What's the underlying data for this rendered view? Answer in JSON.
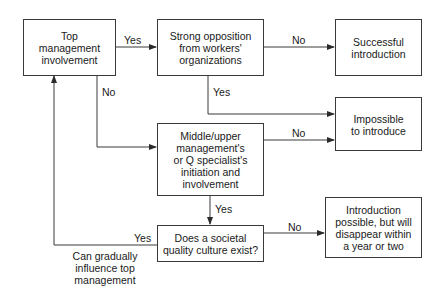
{
  "diagram": {
    "type": "flowchart",
    "nodes": {
      "top_mgmt": "Top\nmanagement\ninvolvement",
      "opposition": "Strong opposition\nfrom workers'\norganizations",
      "successful": "Successful\nintroduction",
      "impossible": "Impossible\nto introduce",
      "middle_mgmt": "Middle/upper\nmanagement's\nor Q specialist's\ninitiation and\ninvolvement",
      "societal": "Does a societal\nquality culture exist?",
      "disappear": "Introduction\npossible, but will\ndisappear within\na year or two"
    },
    "edge_labels": {
      "top_to_opposition": "Yes",
      "top_to_middle": "No",
      "opposition_to_successful": "No",
      "opposition_to_impossible": "Yes",
      "middle_to_impossible": "No",
      "middle_to_societal": "Yes",
      "societal_to_disappear": "No",
      "societal_to_top": "Yes",
      "feedback_note": "Can gradually\ninfluence top\nmanagement"
    },
    "edges": [
      {
        "from": "top_mgmt",
        "to": "opposition",
        "label": "Yes"
      },
      {
        "from": "top_mgmt",
        "to": "middle_mgmt",
        "label": "No"
      },
      {
        "from": "opposition",
        "to": "successful",
        "label": "No"
      },
      {
        "from": "opposition",
        "to": "impossible",
        "label": "Yes"
      },
      {
        "from": "middle_mgmt",
        "to": "impossible",
        "label": "No"
      },
      {
        "from": "middle_mgmt",
        "to": "societal",
        "label": "Yes"
      },
      {
        "from": "societal",
        "to": "disappear",
        "label": "No"
      },
      {
        "from": "societal",
        "to": "top_mgmt",
        "label": "Yes"
      }
    ],
    "colors": {
      "line": "#3a3a3a",
      "background": "#ffffff",
      "text": "#1a1a1a"
    }
  }
}
